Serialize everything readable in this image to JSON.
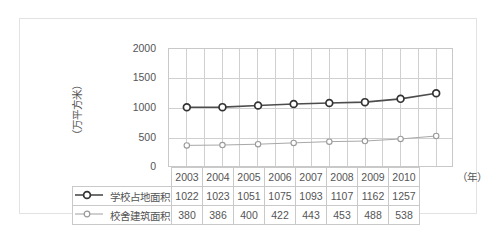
{
  "chart_data": {
    "type": "line",
    "title": "",
    "xlabel": "（年）",
    "ylabel": "（万平方米）",
    "ylim": [
      0,
      2000
    ],
    "yticks": [
      2000,
      1500,
      1000,
      500,
      0
    ],
    "grid": true,
    "legend_position": "table-left",
    "categories": [
      "2003",
      "2004",
      "2005",
      "2006",
      "2007",
      "2008",
      "2009",
      "2010"
    ],
    "series": [
      {
        "name": "学校占地面积",
        "values": [
          1022,
          1023,
          1051,
          1075,
          1093,
          1107,
          1162,
          1257
        ],
        "color": "#4d4d4d",
        "marker": "circle-open-large"
      },
      {
        "name": "校舍建筑面积",
        "values": [
          380,
          386,
          400,
          422,
          443,
          453,
          488,
          538
        ],
        "color": "#a8a8a8",
        "marker": "circle-open-small"
      }
    ]
  },
  "table": {
    "year_header": [
      "2003",
      "2004",
      "2005",
      "2006",
      "2007",
      "2008",
      "2009",
      "2010"
    ],
    "rows": [
      {
        "label": "学校占地面积",
        "values": [
          "1022",
          "1023",
          "1051",
          "1075",
          "1093",
          "1107",
          "1162",
          "1257"
        ]
      },
      {
        "label": "校舍建筑面积",
        "values": [
          "380",
          "386",
          "400",
          "422",
          "443",
          "453",
          "488",
          "538"
        ]
      }
    ]
  },
  "axis": {
    "unit_x": "（年）",
    "unit_y": "（万平方米）",
    "yticks": [
      "2000",
      "1500",
      "1000",
      "500",
      "0"
    ]
  },
  "colors": {
    "series1": "#4d4d4d",
    "series2": "#a8a8a8",
    "grid": "#d0d0d0",
    "border": "#c8c8c8",
    "outer_frame": "#e2e2e2",
    "text": "#555555"
  }
}
